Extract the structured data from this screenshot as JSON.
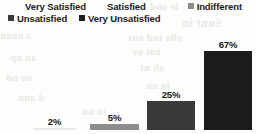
{
  "chart_data": {
    "type": "bar",
    "title": "",
    "subtitle": "",
    "xlabel": "",
    "ylabel": "",
    "grid": false,
    "legend_position": "top",
    "ylim": [
      0,
      75
    ],
    "categories": [
      "Very Satisfied",
      "Satisfied",
      "Indifferent",
      "Unsatisfied",
      "Very Unsatisfied"
    ],
    "values": [
      null,
      2,
      5,
      25,
      67
    ],
    "bars": [
      {
        "category": "Satisfied",
        "value": 2,
        "label": "2%",
        "color": "#e8e8e6"
      },
      {
        "category": "Indifferent",
        "value": 5,
        "label": "5%",
        "color": "#8d8d8c"
      },
      {
        "category": "Unsatisfied",
        "value": 25,
        "label": "25%",
        "color": "#3a3a3a"
      },
      {
        "category": "Very Unsatisfied",
        "value": 67,
        "label": "67%",
        "color": "#1c1c1c"
      }
    ],
    "legend": [
      {
        "label": "Very Satisfied",
        "color": "#ffffff"
      },
      {
        "label": "Satisfied",
        "color": "#f2f2f0"
      },
      {
        "label": "Indifferent",
        "color": "#8d8d8c"
      },
      {
        "label": "Unsatisfied",
        "color": "#3a3a3a"
      },
      {
        "label": "Very Unsatisfied",
        "color": "#1c1c1c"
      }
    ],
    "annotations": [
      "2%",
      "5%",
      "25%",
      "67%"
    ]
  },
  "background_text": {
    "line1": "le and",
    "line2": "Sunt in",
    "line3": "ollo tud ons",
    "line4": "a unon",
    "line5": "not oy",
    "line6": "an up",
    "line7": "ub ut",
    "line8": "no ud",
    "line9": "lo un",
    "line10": "d ann",
    "line11": "to un"
  }
}
